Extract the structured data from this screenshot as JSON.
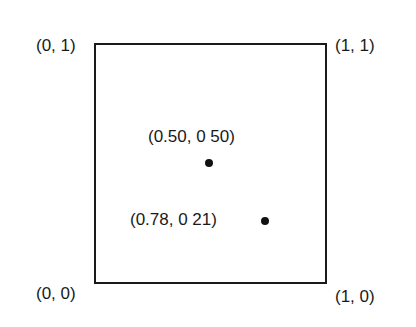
{
  "diagram": {
    "corners": {
      "top_left": "(0, 1)",
      "top_right": "(1, 1)",
      "bottom_left": "(0, 0)",
      "bottom_right": "(1, 0)"
    },
    "points": [
      {
        "label": "(0.50, 0 50)",
        "x": 0.5,
        "y": 0.5
      },
      {
        "label": "(0.78, 0 21)",
        "x": 0.78,
        "y": 0.21
      }
    ],
    "colors": {
      "stroke": "#1a1a1a",
      "background": "#ffffff"
    }
  }
}
